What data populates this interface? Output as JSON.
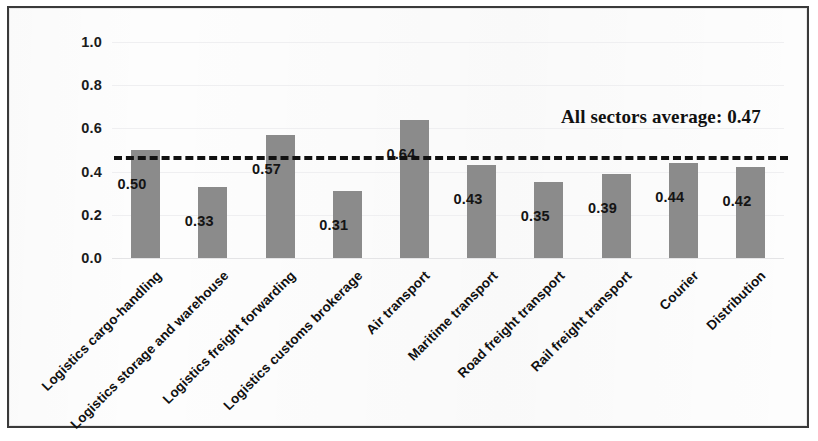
{
  "chart_data": {
    "type": "bar",
    "title": "",
    "subtitle": "",
    "xlabel": "",
    "ylabel": "",
    "ylim": [
      0.0,
      1.0
    ],
    "ytick_labels": [
      "0.0",
      "0.2",
      "0.4",
      "0.6",
      "0.8",
      "1.0"
    ],
    "ytick_values": [
      0.0,
      0.2,
      0.4,
      0.6,
      0.8,
      1.0
    ],
    "grid": true,
    "legend": "none",
    "categories": [
      "Logistics cargo-handling",
      "Logistics storage and warehouse",
      "Logistics freight forwarding",
      "Logistics customs brokerage",
      "Air transport",
      "Maritime transport",
      "Road freight transport",
      "Rail freight transport",
      "Courier",
      "Distribution"
    ],
    "values": [
      0.5,
      0.33,
      0.57,
      0.31,
      0.64,
      0.43,
      0.35,
      0.39,
      0.44,
      0.42
    ],
    "value_labels": [
      "0.50",
      "0.33",
      "0.57",
      "0.31",
      "0.64",
      "0.43",
      "0.35",
      "0.39",
      "0.44",
      "0.42"
    ],
    "bar_color": "#8b8b8b",
    "annotations": [
      {
        "name": "all-sectors-average",
        "text": "All sectors average: 0.47",
        "value": 0.47,
        "style": "dashed-reference-line",
        "line_color": "#111111"
      }
    ]
  }
}
